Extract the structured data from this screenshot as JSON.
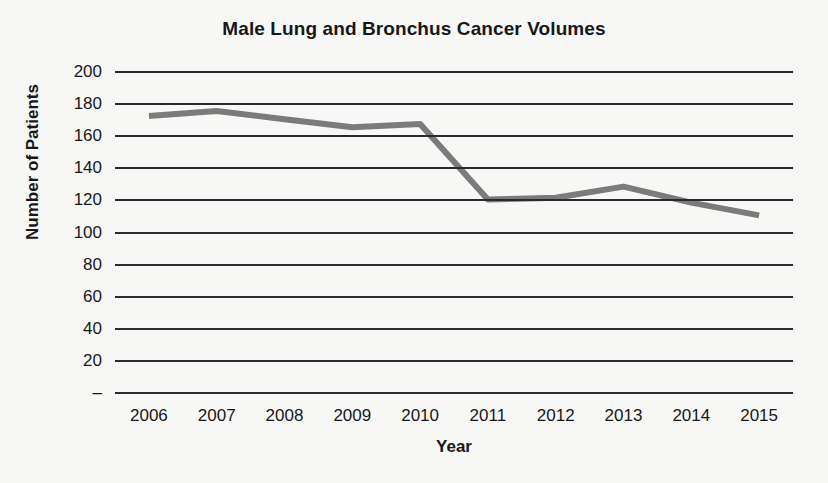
{
  "chart_data": {
    "type": "line",
    "title": "Male Lung and Bronchus Cancer Volumes",
    "xlabel": "Year",
    "ylabel": "Number of Patients",
    "categories": [
      "2006",
      "2007",
      "2008",
      "2009",
      "2010",
      "2011",
      "2012",
      "2013",
      "2014",
      "2015"
    ],
    "values": [
      172,
      175,
      170,
      165,
      167,
      120,
      121,
      128,
      118,
      110
    ],
    "series": [
      {
        "name": "Male Lung and Bronchus Cancer Volumes",
        "values": [
          172,
          175,
          170,
          165,
          167,
          120,
          121,
          128,
          118,
          110
        ]
      }
    ],
    "ylim": [
      0,
      200
    ],
    "ytick_labels": [
      "200",
      "180",
      "160",
      "140",
      "120",
      "100",
      "80",
      "60",
      "40",
      "20",
      "–"
    ],
    "ytick_values": [
      200,
      180,
      160,
      140,
      120,
      100,
      80,
      60,
      40,
      20,
      0
    ],
    "grid": true,
    "legend": false,
    "line_color": "#7b7b7b",
    "grid_color": "#2a2a2e",
    "text_color": "#17171a",
    "background": "#f7f7f5"
  }
}
